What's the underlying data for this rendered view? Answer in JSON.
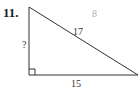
{
  "problem": {
    "number": "11.",
    "figure": "right-triangle",
    "labels": {
      "vertical_leg": "?",
      "hypotenuse": "17",
      "horizontal_leg": "15",
      "faint_answer": "8"
    }
  },
  "colors": {
    "line": "#333333",
    "text": "#222222",
    "faint_text": "#b0b0b0"
  }
}
